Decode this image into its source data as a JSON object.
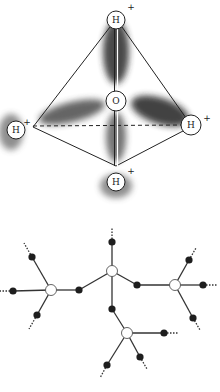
{
  "figure": {
    "top_panel": {
      "title": "Tetrahedral water molecule with hydrogen bonding",
      "center_atom": {
        "label": "O",
        "x": 116,
        "y": 101,
        "r": 10
      },
      "hydrogens": [
        {
          "label": "H",
          "charge": "+",
          "x": 116,
          "y": 20,
          "r": 9,
          "charge_x": 131,
          "charge_y": 7
        },
        {
          "label": "H",
          "charge": "+",
          "x": 16,
          "y": 130,
          "r": 9,
          "charge_x": 27,
          "charge_y": 122
        },
        {
          "label": "H",
          "charge": "+",
          "x": 191,
          "y": 125,
          "r": 10,
          "charge_x": 207,
          "charge_y": 118
        },
        {
          "label": "H",
          "charge": "+",
          "x": 116,
          "y": 182,
          "r": 9,
          "charge_x": 131,
          "charge_y": 171
        }
      ],
      "tetrahedron_vertices": {
        "top": [
          116,
          20
        ],
        "left": [
          33,
          127
        ],
        "right": [
          191,
          125
        ],
        "bottom": [
          116,
          166
        ]
      }
    },
    "bottom_panel": {
      "title": "Hydrogen-bonded network",
      "oxygen_nodes": [
        {
          "id": "left",
          "x": 51,
          "y": 290
        },
        {
          "id": "center",
          "x": 112,
          "y": 271
        },
        {
          "id": "right",
          "x": 175,
          "y": 285
        },
        {
          "id": "bottom",
          "x": 127,
          "y": 333
        }
      ],
      "hydrogen_nodes": [
        {
          "x": 32,
          "y": 257,
          "dots_to": [
            24,
            243
          ]
        },
        {
          "x": 13,
          "y": 291,
          "dots_to": [
            0,
            291
          ]
        },
        {
          "x": 37,
          "y": 315,
          "dots_to": [
            29,
            329
          ]
        },
        {
          "x": 79,
          "y": 290,
          "dots_to": null
        },
        {
          "x": 112,
          "y": 242,
          "dots_to": [
            112,
            228
          ]
        },
        {
          "x": 137,
          "y": 285,
          "dots_to": null
        },
        {
          "x": 112,
          "y": 309,
          "dots_to": null
        },
        {
          "x": 189,
          "y": 260,
          "dots_to": [
            196,
            248
          ]
        },
        {
          "x": 203,
          "y": 285,
          "dots_to": [
            218,
            285
          ]
        },
        {
          "x": 193,
          "y": 318,
          "dots_to": [
            200,
            330
          ]
        },
        {
          "x": 164,
          "y": 333,
          "dots_to": [
            178,
            333
          ]
        },
        {
          "x": 107,
          "y": 365,
          "dots_to": [
            100,
            378
          ]
        },
        {
          "x": 140,
          "y": 357,
          "dots_to": [
            147,
            369
          ]
        }
      ],
      "bonds": [
        [
          "left",
          0
        ],
        [
          "left",
          1
        ],
        [
          "left",
          2
        ],
        [
          "left",
          3
        ],
        [
          "center",
          3
        ],
        [
          "center",
          4
        ],
        [
          "center",
          5
        ],
        [
          "center",
          6
        ],
        [
          "right",
          5
        ],
        [
          "right",
          7
        ],
        [
          "right",
          8
        ],
        [
          "right",
          9
        ],
        [
          "bottom",
          6
        ],
        [
          "bottom",
          10
        ],
        [
          "bottom",
          11
        ],
        [
          "bottom",
          12
        ]
      ]
    }
  }
}
